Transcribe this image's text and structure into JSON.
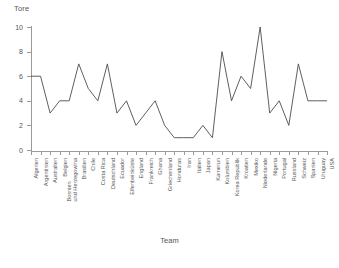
{
  "chart_data": {
    "type": "line",
    "title": "",
    "ylabel": "Tore",
    "xlabel": "Team",
    "ylim": [
      0,
      10
    ],
    "yticks": [
      0,
      2,
      4,
      6,
      8,
      10
    ],
    "ytick_labels": [
      "0",
      "2",
      "4",
      "6",
      "8",
      "10"
    ],
    "grid": false,
    "legend": "none",
    "line_color": "#4d4d4d",
    "categories": [
      "Algerien",
      "Argentinien",
      "Australien",
      "Belgien",
      "Bosnien und Herzegowina",
      "Brasilien",
      "Chile",
      "Costa Rica",
      "Deutschland",
      "Ecuador",
      "Elfenbeinküste",
      "England",
      "Frankreich",
      "Ghana",
      "Griechenland",
      "Honduras",
      "Iran",
      "Italien",
      "Japan",
      "Kamerun",
      "Kolumbien",
      "Korea Republik",
      "Kroatien",
      "Mexiko",
      "Niederlande",
      "Nigeria",
      "Portugal",
      "Russland",
      "Schweiz",
      "Spanien",
      "Uruguay",
      "USA"
    ],
    "values": [
      6,
      6,
      3,
      4,
      4,
      7,
      5,
      4,
      7,
      3,
      4,
      2,
      3,
      4,
      2,
      1,
      1,
      1,
      2,
      1,
      8,
      4,
      6,
      5,
      10,
      3,
      4,
      2,
      7,
      4,
      4,
      4
    ],
    "series": [
      {
        "name": "Tore",
        "values": [
          6,
          6,
          3,
          4,
          4,
          7,
          5,
          4,
          7,
          3,
          4,
          2,
          3,
          4,
          2,
          1,
          1,
          1,
          2,
          1,
          8,
          4,
          6,
          5,
          10,
          3,
          4,
          2,
          7,
          4,
          4,
          4
        ]
      }
    ]
  }
}
